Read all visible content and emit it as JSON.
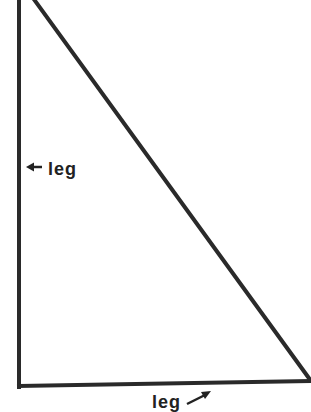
{
  "diagram": {
    "shape": "right-triangle",
    "stroke_color": "#2a2a2a",
    "stroke_width": 4,
    "vertices": {
      "top": [
        19,
        -2
      ],
      "right_angle": [
        19,
        386
      ],
      "bottom_right": [
        311,
        381
      ],
      "hypotenuse_top": [
        33,
        -2
      ]
    },
    "labels": {
      "left_leg": "leg",
      "bottom_leg": "leg"
    },
    "arrows": {
      "left_leg_arrow": "points left to vertical leg",
      "bottom_leg_arrow": "points up-right to horizontal leg"
    }
  }
}
